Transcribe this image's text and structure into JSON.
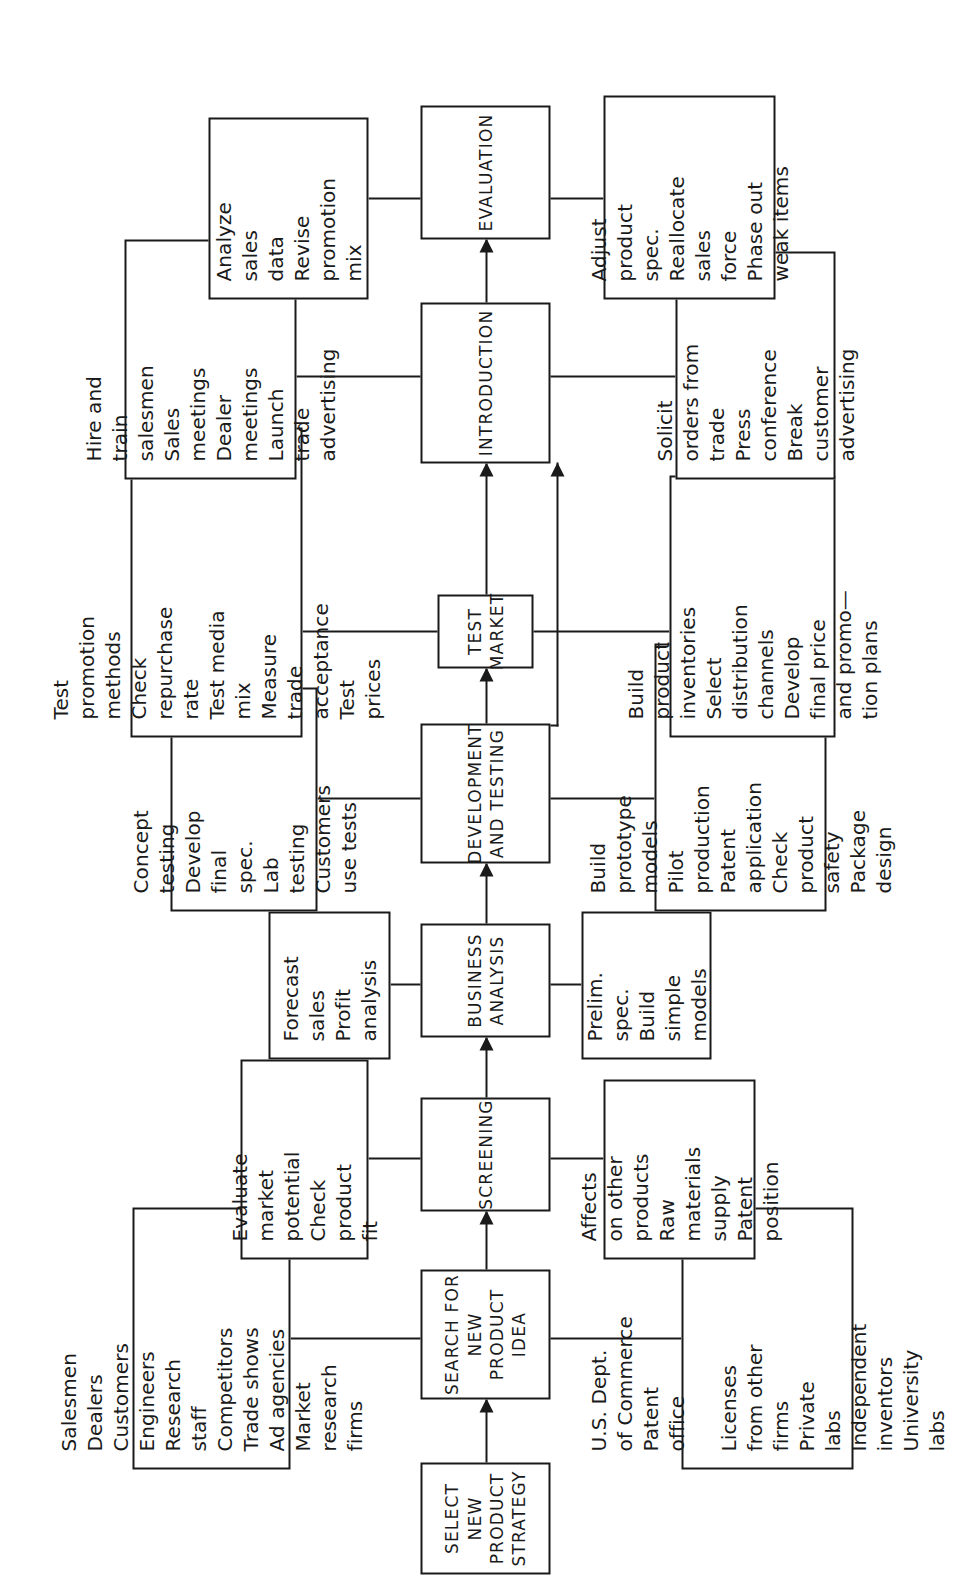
{
  "diagram": {
    "orientation": "rotated-90-ccw",
    "line_color": "#1a1a1a",
    "background": "#ffffff",
    "stages": [
      {
        "id": "strategy",
        "label": "SELECT NEW\nPRODUCT\nSTRATEGY"
      },
      {
        "id": "search",
        "label": "SEARCH FOR\nNEW PRODUCT\nIDEA"
      },
      {
        "id": "screening",
        "label": "SCREENING"
      },
      {
        "id": "business",
        "label": "BUSINESS\nANALYSIS"
      },
      {
        "id": "development",
        "label": "DEVELOPMENT\nAND TESTING"
      },
      {
        "id": "testmarket",
        "label": "TEST\nMARKET"
      },
      {
        "id": "introduction",
        "label": "INTRODUCTION"
      },
      {
        "id": "evaluation",
        "label": "EVALUATION"
      }
    ],
    "satellites": {
      "search_top": "Salesmen\nDealers\nCustomers\nEngineers\nResearch\nstaff\nCompetitors\nTrade shows\nAd agencies\nMarket\nresearch\nfirms",
      "search_bottom": "U.S. Dept.\nof Commerce\nPatent\noffice\n\nLicenses\nfrom other\nfirms\nPrivate\nlabs\nIndependent\ninventors\nUniversity\nlabs",
      "screening_top": "Evaluate\nmarket\npotential\nCheck\nproduct\nfit",
      "screening_bottom": "Affects\non other\nproducts\nRaw\nmaterials\nsupply\nPatent\nposition",
      "business_top": "Forecast\nsales\nProfit\nanalysis",
      "business_bottom": "Prelim.\nspec.\nBuild\nsimple\nmodels",
      "development_top": "Concept\ntesting\nDevelop\nfinal\nspec.\nLab\ntesting\nCustomers\nuse tests",
      "development_bottom": "Build\nprototype\nmodels\nPilot\nproduction\nPatent\napplication\nCheck\nproduct\nsafety\nPackage\ndesign",
      "testmarket_top": "Test\npromotion\nmethods\nCheck\nrepurchase\nrate\nTest media\nmix\nMeasure\ntrade\nacceptance\nTest\nprices",
      "testmarket_bottom": "Build\nproduct\ninventories\nSelect\ndistribution\nchannels\nDevelop\nfinal price\nand promo—\ntion plans",
      "introduction_top": "Hire and\ntrain\nsalesmen\nSales\nmeetings\nDealer\nmeetings\nLaunch\ntrade\nadvertising",
      "introduction_bottom": "Solicit\norders from\ntrade\nPress\nconference\nBreak\ncustomer\nadvertising",
      "evaluation_top": "Analyze\nsales\ndata\nRevise\npromotion\nmix",
      "evaluation_bottom": "Adjust\nproduct\nspec.\nReallocate\nsales\nforce\nPhase out\nweak items"
    },
    "flow": {
      "main_sequence": [
        "strategy",
        "search",
        "screening",
        "business",
        "development",
        "testmarket",
        "introduction",
        "evaluation"
      ],
      "bypass": {
        "from": "development",
        "to": "introduction",
        "note": "skips test market"
      }
    }
  }
}
